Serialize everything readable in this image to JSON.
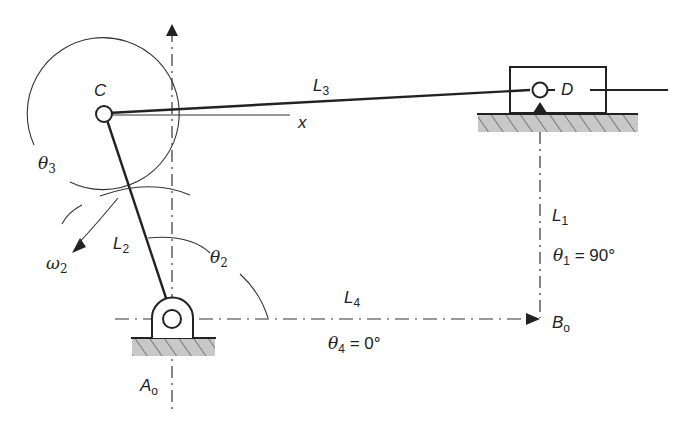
{
  "diagram": {
    "type": "slider-crank mechanism (vector loop)",
    "points": {
      "C": "C",
      "D": "D",
      "A0": {
        "base": "A",
        "sub": "o"
      },
      "B0": {
        "base": "B",
        "sub": "o"
      }
    },
    "links": {
      "L1": {
        "base": "L",
        "sub": "1"
      },
      "L2": {
        "base": "L",
        "sub": "2"
      },
      "L3": {
        "base": "L",
        "sub": "3"
      },
      "L4": {
        "base": "L",
        "sub": "4"
      }
    },
    "angles": {
      "theta1": {
        "base": "θ",
        "sub": "1",
        "value": " = 90°"
      },
      "theta2": {
        "base": "θ",
        "sub": "2"
      },
      "theta3": {
        "base": "θ",
        "sub": "3"
      },
      "theta4": {
        "base": "θ",
        "sub": "4",
        "value": " = 0°"
      }
    },
    "omega2": {
      "base": "ω",
      "sub": "2"
    },
    "x_axis_label": "x",
    "colors": {
      "line": "#222222",
      "hatch_fill": "#c8c8c8"
    }
  }
}
